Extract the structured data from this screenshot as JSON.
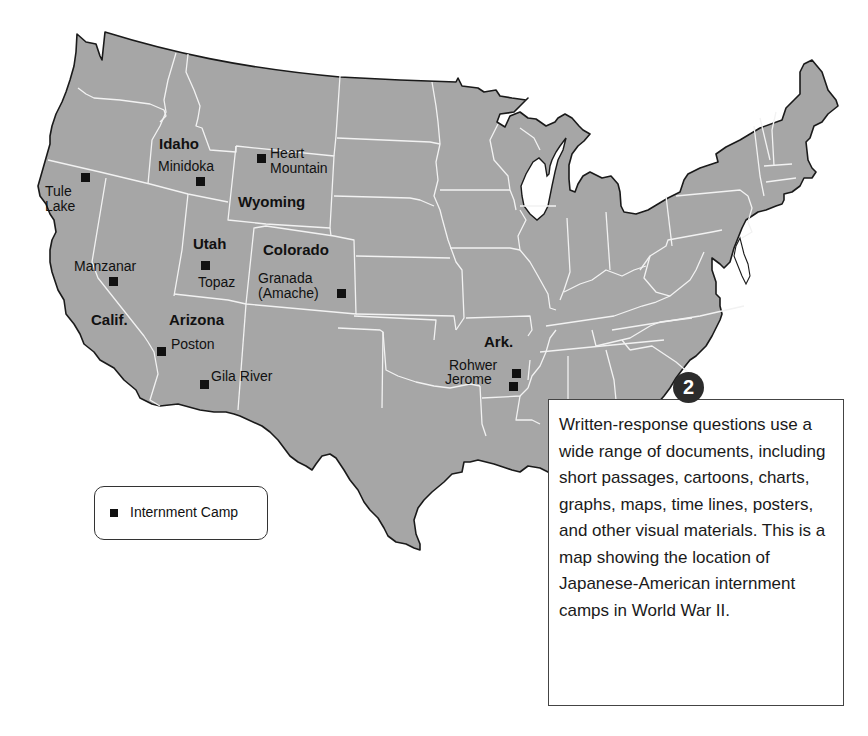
{
  "map": {
    "title": "Japanese-American internment camps in World War II",
    "colors": {
      "land": "#a6a6a6",
      "border": "#f2f2f2",
      "coast": "#1a1a1a",
      "marker": "#111111",
      "water": "#ffffff"
    },
    "states": [
      {
        "id": "idaho",
        "label": "Idaho"
      },
      {
        "id": "wyoming",
        "label": "Wyoming"
      },
      {
        "id": "utah",
        "label": "Utah"
      },
      {
        "id": "colorado",
        "label": "Colorado"
      },
      {
        "id": "california",
        "label": "Calif."
      },
      {
        "id": "arizona",
        "label": "Arizona"
      },
      {
        "id": "arkansas",
        "label": "Ark."
      }
    ],
    "camps": [
      {
        "id": "tule-lake",
        "label": "Tule\nLake"
      },
      {
        "id": "minidoka",
        "label": "Minidoka"
      },
      {
        "id": "heart-mountain",
        "label": "Heart\nMountain"
      },
      {
        "id": "manzanar",
        "label": "Manzanar"
      },
      {
        "id": "topaz",
        "label": "Topaz"
      },
      {
        "id": "granada",
        "label": "Granada\n(Amache)"
      },
      {
        "id": "poston",
        "label": "Poston"
      },
      {
        "id": "gila-river",
        "label": "Gila River"
      },
      {
        "id": "rohwer",
        "label": "Rohwer"
      },
      {
        "id": "jerome",
        "label": "Jerome"
      }
    ]
  },
  "legend": {
    "marker_icon": "square-marker-icon",
    "label": "Internment Camp"
  },
  "callout": {
    "badge": "2",
    "text": "Written-response questions use a wide range of documents, including short passages, cartoons, charts, graphs, maps, time lines, posters, and other visual materials. This is a map showing the location of Japanese-American internment camps in World War II."
  }
}
